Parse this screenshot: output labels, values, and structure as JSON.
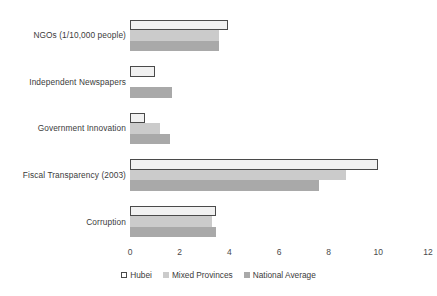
{
  "chart_data": {
    "type": "bar",
    "orientation": "horizontal",
    "title": "",
    "subtitle": "",
    "xlabel": "",
    "ylabel": "",
    "xlim": [
      0,
      12
    ],
    "xticks": [
      0,
      2,
      4,
      6,
      8,
      10,
      12
    ],
    "xtick_labels": [
      "0",
      "2",
      "4",
      "6",
      "8",
      "10",
      "12"
    ],
    "grid": false,
    "legend_position": "bottom-center",
    "categories": [
      "NGOs (1/10,000 people)",
      "Independent Newspapers",
      "Government Innovation",
      "Fiscal Transparency (2003)",
      "Corruption"
    ],
    "series": [
      {
        "name": "Hubei",
        "color": "#f1f1f1",
        "edge_color": "#4a4a4a",
        "values": [
          3.95,
          1.0,
          0.6,
          10.0,
          3.45
        ]
      },
      {
        "name": "Mixed Provinces",
        "color": "#cbcbcb",
        "values": [
          3.6,
          0.0,
          1.2,
          8.7,
          3.3
        ]
      },
      {
        "name": "National Average",
        "color": "#a9a9a9",
        "values": [
          3.6,
          1.7,
          1.6,
          7.6,
          3.45
        ]
      }
    ]
  },
  "legend": {
    "entries": [
      {
        "label": "Hubei"
      },
      {
        "label": "Mixed Provinces"
      },
      {
        "label": "National Average"
      }
    ]
  }
}
